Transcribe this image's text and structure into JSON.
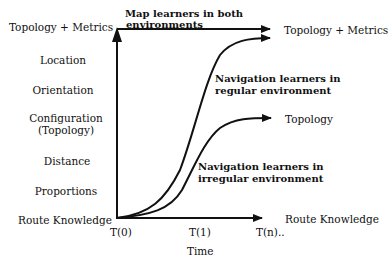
{
  "diagram": {
    "y_axis_levels": [
      {
        "label": "Topology + Metrics",
        "y": 27
      },
      {
        "label": "Location",
        "y": 60
      },
      {
        "label": "Orientation",
        "y": 90
      },
      {
        "label": "Configuration",
        "label2": "(Topology)",
        "y": 118
      },
      {
        "label": "Distance",
        "y": 161
      },
      {
        "label": "Proportions",
        "y": 191
      },
      {
        "label": "Route Knowledge",
        "y": 220
      }
    ],
    "x_axis": {
      "ticks": [
        "T(0)",
        "T(1)",
        "T(n).."
      ],
      "label": "Time"
    },
    "curves": [
      {
        "name": "Map learners in both environments",
        "line1": "Map learners in both",
        "line2": "environments",
        "end_label": "Topology + Metrics"
      },
      {
        "name": "Navigation learners in regular environment",
        "line1": "Navigation learners in",
        "line2": "regular environment",
        "end_label": ""
      },
      {
        "name": "Navigation learners in irregular environment",
        "line1": "Navigation learners in",
        "line2": "irregular environment",
        "end_label": "Topology"
      }
    ],
    "right_labels": {
      "top": "Topology + Metrics",
      "middle": "Topology",
      "bottom": "Route Knowledge"
    }
  }
}
